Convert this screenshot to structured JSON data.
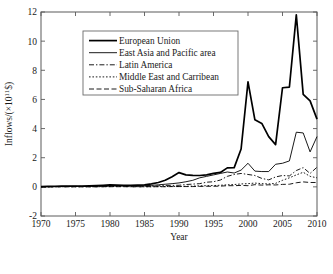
{
  "chart_data": {
    "type": "line",
    "title": "",
    "xlabel": "Year",
    "ylabel": "Inflows/(×10^11$)",
    "ylabel_display": "Inflows/(×10",
    "ylabel_exponent": "11",
    "ylabel_tail": "$)",
    "xlim": [
      1970,
      2010
    ],
    "ylim": [
      -2,
      12
    ],
    "xticks": [
      1970,
      1975,
      1980,
      1985,
      1990,
      1995,
      2000,
      2005,
      2010
    ],
    "yticks": [
      -2,
      0,
      2,
      4,
      6,
      8,
      10,
      12
    ],
    "xtick_labels": [
      "1970",
      "1975",
      "1980",
      "1985",
      "1990",
      "1995",
      "2000",
      "2005",
      "2010"
    ],
    "ytick_labels": [
      "-2",
      "0",
      "2",
      "4",
      "6",
      "8",
      "10",
      "12"
    ],
    "grid": false,
    "legend_position": "upper-left-inset",
    "x": [
      1970,
      1971,
      1972,
      1973,
      1974,
      1975,
      1976,
      1977,
      1978,
      1979,
      1980,
      1981,
      1982,
      1983,
      1984,
      1985,
      1986,
      1987,
      1988,
      1989,
      1990,
      1991,
      1992,
      1993,
      1994,
      1995,
      1996,
      1997,
      1998,
      1999,
      2000,
      2001,
      2002,
      2003,
      2004,
      2005,
      2006,
      2007,
      2008,
      2009,
      2010
    ],
    "series": [
      {
        "name": "European Union",
        "style": "solid",
        "width": 1.7,
        "values": [
          0.02,
          0.03,
          0.04,
          0.06,
          0.05,
          0.06,
          0.06,
          0.07,
          0.09,
          0.11,
          0.13,
          0.12,
          0.11,
          0.11,
          0.12,
          0.14,
          0.21,
          0.3,
          0.45,
          0.7,
          0.98,
          0.82,
          0.79,
          0.78,
          0.82,
          0.92,
          0.99,
          1.3,
          1.32,
          2.6,
          7.2,
          4.6,
          4.35,
          3.45,
          2.9,
          6.8,
          6.85,
          11.8,
          6.35,
          5.9,
          4.65
        ]
      },
      {
        "name": "East Asia and Pacific area",
        "style": "solid",
        "width": 0.9,
        "values": [
          0.01,
          0.01,
          0.02,
          0.03,
          0.03,
          0.03,
          0.03,
          0.03,
          0.04,
          0.05,
          0.06,
          0.07,
          0.06,
          0.06,
          0.07,
          0.08,
          0.1,
          0.14,
          0.18,
          0.22,
          0.27,
          0.35,
          0.45,
          0.62,
          0.72,
          0.82,
          0.92,
          1.02,
          0.95,
          1.15,
          1.62,
          1.08,
          1.05,
          1.05,
          1.55,
          1.62,
          1.78,
          3.75,
          3.7,
          2.4,
          3.45
        ]
      },
      {
        "name": "Latin America",
        "style": "dashdot",
        "width": 0.9,
        "values": [
          0.01,
          0.01,
          0.02,
          0.02,
          0.03,
          0.03,
          0.03,
          0.03,
          0.04,
          0.05,
          0.06,
          0.07,
          0.06,
          0.04,
          0.04,
          0.05,
          0.05,
          0.07,
          0.1,
          0.1,
          0.11,
          0.16,
          0.19,
          0.22,
          0.32,
          0.35,
          0.47,
          0.72,
          0.85,
          0.92,
          0.85,
          0.78,
          0.58,
          0.48,
          0.68,
          0.78,
          0.75,
          1.12,
          1.32,
          0.92,
          1.35
        ]
      },
      {
        "name": "Middle East and Carribean",
        "style": "dotted",
        "width": 0.9,
        "values": [
          0.0,
          0.0,
          0.0,
          0.01,
          0.01,
          0.01,
          0.01,
          0.01,
          0.01,
          0.01,
          0.02,
          0.03,
          0.02,
          0.01,
          0.01,
          0.01,
          0.01,
          0.02,
          0.02,
          0.03,
          0.03,
          0.04,
          0.05,
          0.07,
          0.08,
          0.09,
          0.11,
          0.14,
          0.16,
          0.2,
          0.22,
          0.26,
          0.22,
          0.2,
          0.24,
          0.45,
          0.62,
          0.82,
          1.0,
          0.72,
          0.62
        ]
      },
      {
        "name": "Sub-Saharan Africa",
        "style": "dashed",
        "width": 0.9,
        "values": [
          0.0,
          0.0,
          0.0,
          0.0,
          0.0,
          0.0,
          0.0,
          0.0,
          0.0,
          0.01,
          0.01,
          0.01,
          0.01,
          0.01,
          0.0,
          0.01,
          0.01,
          0.01,
          0.01,
          0.02,
          0.02,
          0.02,
          0.02,
          0.03,
          0.04,
          0.04,
          0.05,
          0.08,
          0.08,
          0.1,
          0.08,
          0.15,
          0.12,
          0.14,
          0.13,
          0.17,
          0.18,
          0.28,
          0.34,
          0.3,
          0.3
        ]
      }
    ]
  },
  "legend": {
    "items": [
      {
        "label": "European Union"
      },
      {
        "label": "East Asia and Pacific area"
      },
      {
        "label": "Latin America"
      },
      {
        "label": "Middle East and Carribean"
      },
      {
        "label": "Sub-Saharan Africa"
      }
    ]
  },
  "colors": {
    "line": "#000000",
    "axis": "#5a5a5a",
    "background": "#ffffff"
  }
}
